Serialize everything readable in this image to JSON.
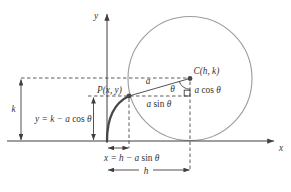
{
  "colors": {
    "background": "#ffffff",
    "axis": "#3f3f3f",
    "dashed": "#4a4a4a",
    "circle": "#9b9b9b",
    "curve": "#474747",
    "text": "#333333"
  },
  "labels": {
    "y_axis": "y",
    "x_axis": "x",
    "center": "C(h, k)",
    "point": "P(x, y)",
    "radius": "a",
    "angle": "θ",
    "k_dim": "k",
    "h_dim": "h",
    "a_cos": {
      "pre": "a ",
      "fn": "cos",
      "post": " θ"
    },
    "a_sin": {
      "pre": "a ",
      "fn": "sin",
      "post": " θ"
    },
    "eq_y": {
      "pre": "y = k − a ",
      "fn": "cos",
      "post": " θ"
    },
    "eq_x": {
      "pre": "x = h − a ",
      "fn": "sin",
      "post": " θ"
    }
  }
}
